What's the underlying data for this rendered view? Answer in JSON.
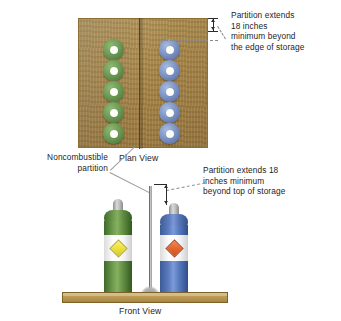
{
  "figure": {
    "background_color": "#ffffff"
  },
  "annotations": {
    "top_right": {
      "text": "Partition extends\n18 inches\nminimum beyond\nthe edge of storage",
      "lines": [
        "Partition extends",
        "18 inches",
        "minimum beyond",
        "the edge of storage"
      ]
    },
    "mid_right": {
      "text": "Partition extends 18\ninches minimum\nbeyond top of storage",
      "lines": [
        "Partition extends 18",
        "inches minimum",
        "beyond top of storage"
      ]
    },
    "left_label": {
      "text": "Noncombustible\npartition",
      "lines": [
        "Noncombustible",
        "partition"
      ]
    }
  },
  "views": {
    "plan": {
      "label": "Plan View",
      "floor_color": "#b28d4a",
      "partition_color": "#4c4235",
      "left_group": {
        "name": "green-cylinder-group",
        "color": "#6f9e57",
        "count": 5,
        "hub_color": "#fdfdfa"
      },
      "right_group": {
        "name": "blue-cylinder-group",
        "color": "#8097c8",
        "count": 5,
        "hub_color": "#fdfdfa"
      }
    },
    "front": {
      "label": "Front View",
      "floor_color": "#bb9a56",
      "partition_color": "#c0c0c0",
      "cylinders": [
        {
          "name": "green-cylinder",
          "body_color": "#6d9a4c",
          "cap_color": "#c2c2c2",
          "label_band_color": "#ffffff",
          "placard_color": "#eade3a",
          "placard_shape": "diamond"
        },
        {
          "name": "blue-cylinder",
          "body_color": "#5a7bbe",
          "cap_color": "#c2c2c2",
          "label_band_color": "#ffffff",
          "placard_color": "#e2642c",
          "placard_shape": "diamond"
        }
      ]
    }
  },
  "dimensions": {
    "plan_extension": {
      "name": "plan-view-extension-dimension",
      "value": "18 inches",
      "orientation": "vertical"
    },
    "front_extension": {
      "name": "front-view-extension-dimension",
      "value": "18 inches",
      "orientation": "vertical"
    }
  }
}
